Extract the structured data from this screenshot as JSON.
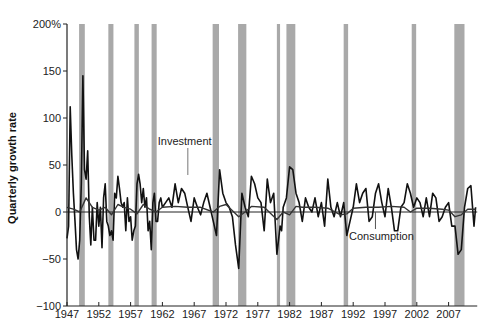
{
  "chart_data": {
    "type": "line",
    "title": "",
    "xlabel": "",
    "ylabel": "Quarterly growth rate",
    "ylim": [
      -100,
      200
    ],
    "xlim": [
      1947,
      2011.5
    ],
    "y_ticks": [
      "200%",
      "150",
      "100",
      "50",
      "0",
      "−50",
      "−100"
    ],
    "y_tick_values": [
      200,
      150,
      100,
      50,
      0,
      -50,
      -100
    ],
    "x_ticks": [
      "1947",
      "1952",
      "1957",
      "1962",
      "1967",
      "1972",
      "1977",
      "1982",
      "1987",
      "1992",
      "1997",
      "2002",
      "2007"
    ],
    "x_tick_values": [
      1947,
      1952,
      1957,
      1962,
      1967,
      1972,
      1977,
      1982,
      1987,
      1992,
      1997,
      2002,
      2007
    ],
    "grid": false,
    "legend": "inline annotations",
    "annotations": [
      {
        "text": "Investment",
        "x": 1965.5,
        "y": 52
      },
      {
        "text": "Consumption",
        "x": 1995.5,
        "y": -19
      }
    ],
    "recessions": [
      [
        1948.9,
        1949.8
      ],
      [
        1953.5,
        1954.3
      ],
      [
        1957.6,
        1958.3
      ],
      [
        1960.3,
        1961.1
      ],
      [
        1969.9,
        1970.9
      ],
      [
        1973.9,
        1975.2
      ],
      [
        1980.0,
        1980.5
      ],
      [
        1981.5,
        1982.9
      ],
      [
        1990.5,
        1991.2
      ],
      [
        2001.2,
        2001.9
      ],
      [
        2007.9,
        2009.5
      ]
    ],
    "series": [
      {
        "name": "Investment",
        "color": "#111111",
        "x": [
          1947.0,
          1947.25,
          1947.5,
          1947.75,
          1948.0,
          1948.25,
          1948.5,
          1948.75,
          1949.0,
          1949.25,
          1949.5,
          1949.75,
          1950.0,
          1950.25,
          1950.5,
          1950.75,
          1951.0,
          1951.25,
          1951.5,
          1951.75,
          1952.0,
          1952.25,
          1952.5,
          1952.75,
          1953.0,
          1953.25,
          1953.5,
          1953.75,
          1954.0,
          1954.25,
          1954.5,
          1954.75,
          1955.0,
          1955.25,
          1955.5,
          1955.75,
          1956.0,
          1956.25,
          1956.5,
          1956.75,
          1957.0,
          1957.25,
          1957.5,
          1957.75,
          1958.0,
          1958.25,
          1958.5,
          1958.75,
          1959.0,
          1959.25,
          1959.5,
          1959.75,
          1960.0,
          1960.25,
          1960.5,
          1960.75,
          1961.0,
          1961.25,
          1961.5,
          1961.75,
          1962.0,
          1962.5,
          1963.0,
          1963.5,
          1964.0,
          1964.5,
          1965.0,
          1965.5,
          1966.0,
          1966.5,
          1967.0,
          1967.5,
          1968.0,
          1968.5,
          1969.0,
          1969.5,
          1970.0,
          1970.5,
          1971.0,
          1971.5,
          1972.0,
          1972.5,
          1973.0,
          1973.5,
          1974.0,
          1974.5,
          1975.0,
          1975.5,
          1976.0,
          1976.5,
          1977.0,
          1977.5,
          1978.0,
          1978.5,
          1979.0,
          1979.5,
          1980.0,
          1980.25,
          1980.5,
          1980.75,
          1981.0,
          1981.5,
          1982.0,
          1982.5,
          1983.0,
          1983.5,
          1984.0,
          1984.5,
          1985.0,
          1985.5,
          1986.0,
          1986.5,
          1987.0,
          1987.5,
          1988.0,
          1988.5,
          1989.0,
          1989.5,
          1990.0,
          1990.5,
          1991.0,
          1991.5,
          1992.0,
          1992.5,
          1993.0,
          1993.5,
          1994.0,
          1994.5,
          1995.0,
          1995.5,
          1996.0,
          1996.5,
          1997.0,
          1997.5,
          1998.0,
          1998.5,
          1999.0,
          1999.5,
          2000.0,
          2000.5,
          2001.0,
          2001.5,
          2002.0,
          2002.5,
          2003.0,
          2003.5,
          2004.0,
          2004.5,
          2005.0,
          2005.5,
          2006.0,
          2006.5,
          2007.0,
          2007.5,
          2008.0,
          2008.5,
          2009.0,
          2009.5,
          2010.0,
          2010.5,
          2011.0,
          2011.25
        ],
        "values": [
          -28,
          -15,
          112,
          60,
          20,
          -10,
          -40,
          -50,
          -30,
          30,
          145,
          45,
          35,
          65,
          -5,
          -35,
          5,
          -30,
          -30,
          10,
          -15,
          5,
          -38,
          15,
          30,
          -10,
          -15,
          -25,
          -20,
          -30,
          20,
          15,
          38,
          25,
          10,
          5,
          10,
          -20,
          15,
          -10,
          -5,
          -30,
          -20,
          -15,
          30,
          40,
          30,
          10,
          25,
          5,
          15,
          -20,
          -10,
          -40,
          10,
          20,
          -10,
          -10,
          10,
          15,
          5,
          10,
          15,
          5,
          30,
          10,
          25,
          20,
          5,
          -10,
          15,
          5,
          -3,
          10,
          20,
          5,
          -10,
          -25,
          45,
          20,
          10,
          5,
          -5,
          -35,
          -60,
          20,
          5,
          -5,
          38,
          30,
          15,
          10,
          -20,
          35,
          10,
          20,
          -45,
          -30,
          -15,
          -20,
          5,
          15,
          48,
          45,
          20,
          10,
          -10,
          15,
          5,
          0,
          15,
          -5,
          10,
          -15,
          35,
          5,
          -5,
          10,
          -5,
          10,
          -25,
          -10,
          5,
          30,
          10,
          20,
          25,
          -10,
          -5,
          20,
          30,
          10,
          -5,
          25,
          5,
          -20,
          -20,
          5,
          10,
          30,
          20,
          5,
          15,
          10,
          -5,
          15,
          -5,
          20,
          15,
          -10,
          -5,
          5,
          10,
          -15,
          -15,
          -45,
          -40,
          5,
          25,
          28,
          -15,
          5
        ],
        "note": "approximate trace read from pixels"
      },
      {
        "name": "Consumption",
        "color": "#333333",
        "x": [
          1947,
          1948,
          1949,
          1950,
          1951,
          1952,
          1953,
          1954,
          1955,
          1956,
          1957,
          1958,
          1959,
          1960,
          1961,
          1962,
          1964,
          1966,
          1968,
          1970,
          1971,
          1972,
          1974,
          1975,
          1976,
          1978,
          1980,
          1981,
          1982,
          1983,
          1984,
          1986,
          1988,
          1990,
          1991,
          1992,
          1994,
          1996,
          1998,
          2000,
          2001,
          2002,
          2004,
          2006,
          2007,
          2008,
          2009,
          2010,
          2011.25
        ],
        "values": [
          5,
          3,
          0,
          15,
          5,
          2,
          5,
          -3,
          8,
          5,
          3,
          -2,
          8,
          3,
          0,
          5,
          6,
          5,
          5,
          0,
          6,
          8,
          -5,
          0,
          6,
          5,
          -8,
          0,
          -3,
          6,
          5,
          5,
          4,
          -3,
          -2,
          4,
          5,
          5,
          6,
          5,
          0,
          4,
          4,
          3,
          2,
          -5,
          -3,
          3,
          3
        ],
        "note": "approximate trace read from pixels"
      }
    ]
  },
  "labels": {
    "ylabel": "Quarterly growth rate",
    "investment": "Investment",
    "consumption": "Consumption"
  },
  "colors": {
    "recession_band": "#a9a9a9",
    "line": "#111111",
    "axis": "#222222"
  }
}
